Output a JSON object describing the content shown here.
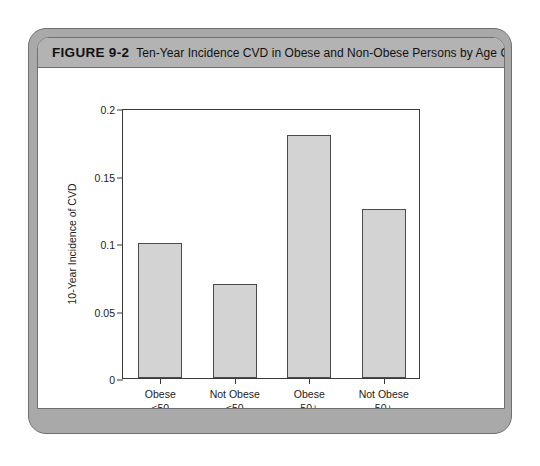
{
  "figure": {
    "number_label": "FIGURE 9-2",
    "caption": "Ten-Year Incidence CVD in Obese and Non-Obese Persons by Age Group",
    "card_color": "#a9a9a9",
    "title_band_color": "#b3b3b3",
    "bar_fill_color": "#d3d3d3",
    "bar_border_color": "#4a4a4a"
  },
  "chart_data": {
    "type": "bar",
    "title": "Ten-Year Incidence CVD in Obese and Non-Obese Persons by Age Group",
    "categories": [
      "Obese\n<50",
      "Not Obese\n<50",
      "Obese\n50+",
      "Not Obese\n50+"
    ],
    "category_lines": [
      [
        "Obese",
        "<50"
      ],
      [
        "Not Obese",
        "<50"
      ],
      [
        "Obese",
        "50+"
      ],
      [
        "Not Obese",
        "50+"
      ]
    ],
    "values": [
      0.1,
      0.07,
      0.18,
      0.125
    ],
    "xlabel": "",
    "ylabel": "10-Year Incidence of CVD",
    "ylim": [
      0,
      0.2
    ],
    "ytick_values": [
      0,
      0.05,
      0.1,
      0.15,
      0.2
    ],
    "ytick_labels": [
      "0",
      "0.05",
      "0.1",
      "0.15",
      "0.2"
    ],
    "grid": false,
    "legend": false
  }
}
